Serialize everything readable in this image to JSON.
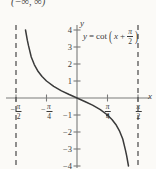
{
  "figure": {
    "interval_note": "(−∞, ∞)",
    "background_color": "#fbfaf7",
    "curve_color": "#3a3a3a",
    "axis_color": "#6e6e6e",
    "asymptote_color": "#555555"
  },
  "chart_data": {
    "type": "line",
    "title": "",
    "equation": "y = cot(x + π/2)",
    "equation_parts": {
      "lhs": "y",
      "equals": "=",
      "func": "cot",
      "arg_x": "x",
      "arg_plus": "+",
      "arg_frac_num": "π",
      "arg_frac_den": "2"
    },
    "xlabel": "x",
    "ylabel": "y",
    "xlim": [
      -1.5707963,
      1.5707963
    ],
    "ylim": [
      -4.4,
      4.4
    ],
    "grid": false,
    "legend": "none",
    "xticks": [
      {
        "value": -1.5707963,
        "label": "-π/2",
        "sign": "−",
        "num": "π",
        "den": "2"
      },
      {
        "value": -0.7853982,
        "label": "-π/4",
        "sign": "−",
        "num": "π",
        "den": "4"
      },
      {
        "value": 0.7853982,
        "label": "π/4",
        "sign": "",
        "num": "π",
        "den": "4"
      },
      {
        "value": 1.5707963,
        "label": "π/2",
        "sign": "",
        "num": "π",
        "den": "2"
      }
    ],
    "yticks": [
      {
        "value": 4,
        "label": "4"
      },
      {
        "value": 3,
        "label": "3"
      },
      {
        "value": 2,
        "label": "2"
      },
      {
        "value": 1,
        "label": "1"
      },
      {
        "value": -1,
        "label": "−1"
      },
      {
        "value": -2,
        "label": "−2"
      },
      {
        "value": -3,
        "label": "−3"
      },
      {
        "value": -4,
        "label": "−4"
      }
    ],
    "asymptotes": [
      {
        "x": -1.5707963,
        "style": "dashed"
      },
      {
        "x": 1.5707963,
        "style": "dashed"
      }
    ],
    "series": [
      {
        "name": "y = cot(x + pi/2)",
        "note": "equals -tan(x) on (-pi/2, pi/2)",
        "points": [
          [
            -1.3258,
            4.0
          ],
          [
            -1.2793,
            3.4
          ],
          [
            -1.249,
            3.08
          ],
          [
            -1.1781,
            2.414
          ],
          [
            -1.1,
            1.965
          ],
          [
            -1.0,
            1.557
          ],
          [
            -0.9,
            1.26
          ],
          [
            -0.7854,
            1.0
          ],
          [
            -0.6,
            0.684
          ],
          [
            -0.4,
            0.423
          ],
          [
            -0.2,
            0.203
          ],
          [
            0.0,
            0.0
          ],
          [
            0.2,
            -0.203
          ],
          [
            0.4,
            -0.423
          ],
          [
            0.6,
            -0.684
          ],
          [
            0.7854,
            -1.0
          ],
          [
            0.9,
            -1.26
          ],
          [
            1.0,
            -1.557
          ],
          [
            1.1,
            -1.965
          ],
          [
            1.1781,
            -2.414
          ],
          [
            1.249,
            -3.08
          ],
          [
            1.2793,
            -3.4
          ],
          [
            1.3258,
            -4.0
          ]
        ]
      }
    ],
    "marked_points": [
      {
        "x": 0.7854,
        "y": -1.0
      }
    ]
  }
}
